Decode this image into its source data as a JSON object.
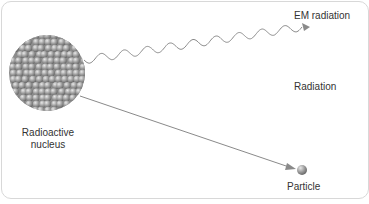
{
  "diagram": {
    "labels": {
      "nucleus_line1": "Radioactive",
      "nucleus_line2": "nucleus",
      "em": "EM radiation",
      "radiation": "Radiation",
      "particle": "Particle"
    },
    "colors": {
      "sphere": "#9a9a9a",
      "arrow": "#8a8a8a",
      "text": "#333333",
      "border": "#d8d8d8"
    }
  }
}
